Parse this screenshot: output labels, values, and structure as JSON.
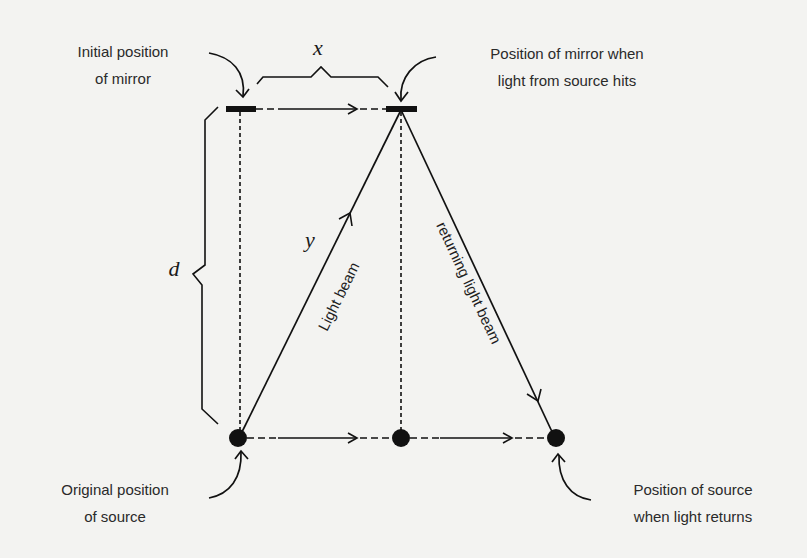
{
  "diagram": {
    "labels": {
      "initial_mirror": [
        "Initial position",
        "of mirror"
      ],
      "mirror_when_hit": [
        "Position of mirror when",
        "light from source hits"
      ],
      "original_source": [
        "Original position",
        "of source"
      ],
      "source_when_returns": [
        "Position of source",
        "when light returns"
      ]
    },
    "variables": {
      "horizontal": "x",
      "vertical": "d",
      "hypotenuse": "y"
    },
    "beams": {
      "outgoing": "Light beam",
      "returning": "returning light beam"
    },
    "colors": {
      "background": "#f3f3f1",
      "ink": "#111111",
      "text": "#2a2a2a"
    }
  }
}
